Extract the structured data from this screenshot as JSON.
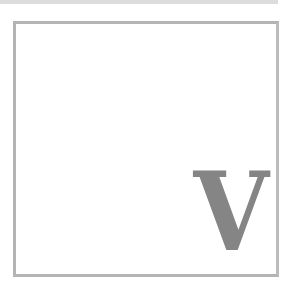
{
  "card": {
    "letter": "V",
    "letter_color": "#858585",
    "border_color": "#b4b4b4"
  }
}
